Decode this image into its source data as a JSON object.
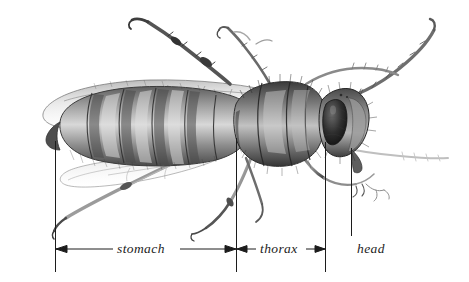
{
  "figure": {
    "view": "lateral",
    "medium": "graphite pencil illustration",
    "background_color": "#ffffff",
    "ink_color": "#1c1c1c",
    "width": 469,
    "height": 282
  },
  "labels": [
    {
      "id": "stomach",
      "text": "stomach",
      "style": "italic-serif"
    },
    {
      "id": "thorax",
      "text": "thorax",
      "style": "italic-serif"
    },
    {
      "id": "head",
      "text": "head",
      "style": "italic-serif"
    }
  ],
  "measure_line": {
    "baseline_y": 249,
    "tick_color": "#1c1c1c",
    "ticks": [
      {
        "id": "abdomen-left",
        "x": 55,
        "y_top": 141,
        "y_bottom": 272
      },
      {
        "id": "abdomen-thorax",
        "x": 236,
        "y_top": 138,
        "y_bottom": 272
      },
      {
        "id": "thorax-head",
        "x": 325,
        "y_top": 142,
        "y_bottom": 272
      },
      {
        "id": "head-right",
        "x": 351,
        "y_top": 148,
        "y_bottom": 236
      }
    ],
    "spans": [
      {
        "id": "stomach",
        "x_start": 55,
        "x_end": 236,
        "arrows": "both"
      },
      {
        "id": "thorax",
        "x_start": 236,
        "x_end": 325,
        "arrows": "both"
      }
    ]
  }
}
